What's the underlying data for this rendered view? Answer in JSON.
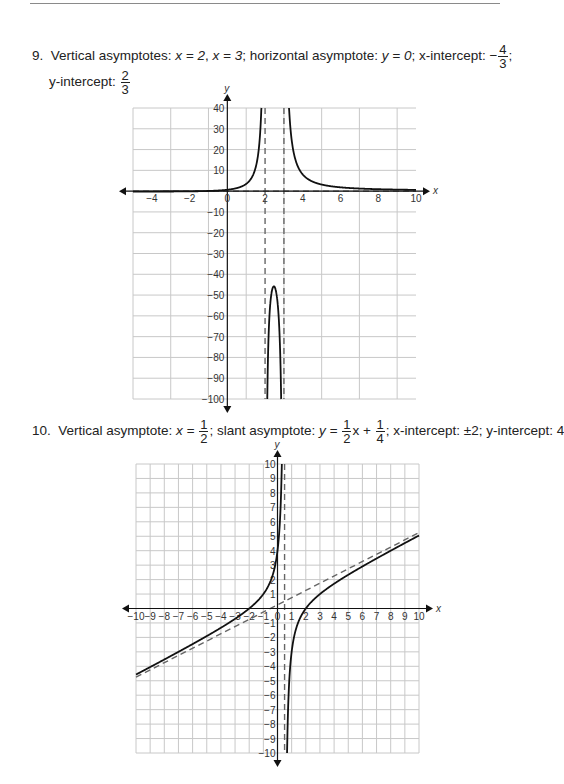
{
  "problems": [
    {
      "number": "9.",
      "line1_a": "Vertical asymptotes: ",
      "va1": "x = 2",
      "va2": "x = 3",
      "ha_label": "; horizontal asymptote: ",
      "ha": "y = 0",
      "xint_label": "; x-intercept: ",
      "xint_sign": "−",
      "xint_num": "4",
      "xint_den": "3",
      "xint_end": ";",
      "yint_label": "y-intercept: ",
      "yint_num": "2",
      "yint_den": "3"
    },
    {
      "number": "10.",
      "va_label": "Vertical asymptote: ",
      "va_x": "x = ",
      "va_num": "1",
      "va_den": "2",
      "slant_label": "; slant asymptote: ",
      "slant_y": "y = ",
      "slant_num1": "1",
      "slant_den1": "2",
      "slant_mid": "x + ",
      "slant_num2": "1",
      "slant_den2": "4",
      "rest": "; x-intercept: ±2; y-intercept: 4"
    }
  ],
  "chart_data": [
    {
      "type": "line",
      "title": "",
      "xlabel": "x",
      "ylabel": "y",
      "xlim": [
        -5,
        10
      ],
      "ylim": [
        -100,
        40
      ],
      "grid": true,
      "x_ticks": [
        -4,
        -2,
        0,
        2,
        4,
        6,
        8,
        10
      ],
      "y_ticks": [
        40,
        30,
        20,
        10,
        -10,
        -20,
        -30,
        -40,
        -50,
        -60,
        -70,
        -80,
        -90,
        -100
      ],
      "function": "f(x) = (3x + 4) / ((x - 2)(x - 3))",
      "series": [
        {
          "name": "f(x)",
          "style": "solid",
          "x": [
            -5,
            -4,
            -2,
            -1.333,
            0,
            1,
            1.5,
            1.8,
            2.25,
            2.5,
            2.75,
            3.2,
            3.5,
            4,
            5,
            6,
            8,
            10
          ],
          "y": [
            -0.2,
            -0.19,
            -0.1,
            0,
            0.67,
            3.5,
            11.6,
            47.0,
            -46.0,
            -46.0,
            -55.7,
            57.5,
            19.3,
            8.0,
            3.17,
            1.83,
            0.93,
            0.61
          ]
        }
      ],
      "asymptotes": [
        {
          "type": "vertical",
          "x": 2,
          "style": "dashed"
        },
        {
          "type": "vertical",
          "x": 3,
          "style": "dashed"
        },
        {
          "type": "horizontal",
          "y": 0,
          "style": "dashed"
        }
      ]
    },
    {
      "type": "line",
      "title": "",
      "xlabel": "x",
      "ylabel": "y",
      "xlim": [
        -10,
        10
      ],
      "ylim": [
        -10,
        10
      ],
      "grid": true,
      "x_ticks": [
        -10,
        -9,
        -8,
        -7,
        -6,
        -5,
        -4,
        -3,
        -2,
        -1,
        0,
        1,
        2,
        3,
        4,
        5,
        6,
        7,
        8,
        9,
        10
      ],
      "y_ticks": [
        10,
        9,
        8,
        7,
        6,
        5,
        4,
        3,
        2,
        1,
        -1,
        -2,
        -3,
        -4,
        -5,
        -6,
        -7,
        -8,
        -9,
        -10
      ],
      "function": "f(x) = (x^2 - 4) / (2x - 1)",
      "series": [
        {
          "name": "f(x)",
          "style": "solid",
          "x": [
            -10,
            -8,
            -6,
            -4,
            -2,
            -1,
            0,
            0.3,
            0.4,
            0.6,
            0.8,
            1,
            2,
            3,
            4,
            6,
            8,
            10
          ],
          "y": [
            -4.57,
            -3.53,
            -2.46,
            -1.33,
            0,
            1.0,
            4.0,
            9.6,
            19.2,
            -18.2,
            -5.6,
            -3.0,
            0,
            1.0,
            1.71,
            2.91,
            3.94,
            5.05
          ]
        }
      ],
      "asymptotes": [
        {
          "type": "vertical",
          "x": 0.5,
          "style": "dashed"
        },
        {
          "type": "slant",
          "slope": 0.5,
          "intercept": 0.25,
          "style": "dashed"
        }
      ]
    }
  ],
  "plot_boxes": [
    {
      "left": 133,
      "top": 108,
      "right": 416,
      "bottom": 399
    },
    {
      "left": 136,
      "top": 464,
      "right": 419,
      "bottom": 753
    }
  ],
  "colors": {
    "grid": "#c8c8c8",
    "axis": "#111111",
    "curve": "#111111",
    "asymptote": "#666666"
  }
}
